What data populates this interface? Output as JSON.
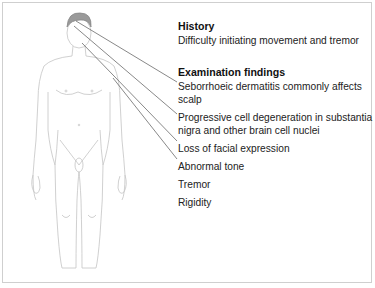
{
  "history": {
    "heading": "History",
    "text": "Difficulty initiating movement and tremor"
  },
  "examination": {
    "heading": "Examination findings",
    "findings": [
      {
        "line1": "Seborrhoeic dermatitis commonly affects",
        "line2": "scalp"
      },
      {
        "line1": "Progressive cell degeneration in substantia",
        "line2": "nigra and other brain cell nuclei"
      },
      {
        "line1": "Loss of facial expression"
      },
      {
        "line1": "Abnormal tone"
      },
      {
        "line1": "Tremor"
      },
      {
        "line1": "Rigidity"
      }
    ]
  },
  "colors": {
    "hair": "#999999",
    "outline": "#bbbbbb",
    "leader": "#555555"
  }
}
